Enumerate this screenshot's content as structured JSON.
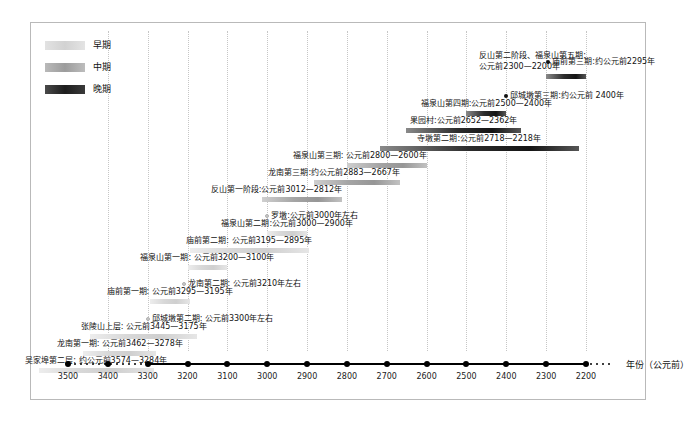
{
  "legend": {
    "items": [
      {
        "label": "早期",
        "key": "early",
        "color": "#d8d8d8"
      },
      {
        "label": "中期",
        "key": "middle",
        "color": "#9c9c9c"
      },
      {
        "label": "晚期",
        "key": "late",
        "color": "#1d1d1d"
      }
    ]
  },
  "axis": {
    "title": "年份（公元前）",
    "ticks": [
      3500,
      3400,
      3300,
      3200,
      3100,
      3000,
      2900,
      2800,
      2700,
      2600,
      2500,
      2400,
      2300,
      2200
    ],
    "domain_start": 3500,
    "domain_end": 2200,
    "dotted_left_from": 3500,
    "dotted_left_to": 3300,
    "dotted_right": true
  },
  "chart_data": {
    "type": "bar",
    "title": "",
    "xlabel": "年份（公元前）",
    "ylabel": "",
    "xlim": [
      3500,
      2200
    ],
    "grid": true,
    "orientation": "horizontal-timeline",
    "legend_position": "top-left",
    "series": [
      {
        "name": "早期",
        "color": "#d8d8d8"
      },
      {
        "name": "中期",
        "color": "#9c9c9c"
      },
      {
        "name": "晚期",
        "color": "#1d1d1d"
      }
    ],
    "items": [
      {
        "label": "庙前第三期:约公元前2295年",
        "start": 2295,
        "end": 2295,
        "period": "late",
        "label_align": "right",
        "marker": "dot",
        "row": 0
      },
      {
        "label": "反山第二阶段、福泉山第五期: 公元前2300—2200年",
        "start": 2300,
        "end": 2200,
        "period": "late",
        "label_align": "right",
        "marker": "bar",
        "row": 1,
        "two_line": true,
        "line1": "反山第二阶段、福泉山第五期:",
        "line2": "公元前2300—2200年"
      },
      {
        "label": "邱城墩第三期:约公元前 2400年",
        "start": 2400,
        "end": 2400,
        "period": "late",
        "label_align": "right",
        "marker": "dot",
        "row": 2
      },
      {
        "label": "福泉山第四期:公元前2500—2400年",
        "start": 2500,
        "end": 2400,
        "period": "late",
        "label_align": "mid",
        "marker": "bar",
        "row": 3
      },
      {
        "label": "果园村:公元前2652—2362年",
        "start": 2652,
        "end": 2362,
        "period": "late",
        "label_align": "mid",
        "marker": "bar",
        "row": 4
      },
      {
        "label": "寺墩第二期:公元前2718—2218年",
        "start": 2718,
        "end": 2218,
        "period": "late",
        "label_align": "mid",
        "marker": "bar",
        "row": 5
      },
      {
        "label": "福泉山第三期: 公元前2800—2600年",
        "start": 2800,
        "end": 2600,
        "period": "middle",
        "label_align": "right",
        "marker": "bar",
        "row": 6
      },
      {
        "label": "龙南第三期:约公元前2883—2667年",
        "start": 2883,
        "end": 2667,
        "period": "middle",
        "label_align": "right",
        "marker": "bar",
        "row": 7
      },
      {
        "label": "反山第一阶段:公元前3012—2812年",
        "start": 3012,
        "end": 2812,
        "period": "middle",
        "label_align": "right",
        "marker": "bar",
        "row": 8
      },
      {
        "label": "罗墩:公元前3000年左右",
        "start": 3000,
        "end": 3000,
        "period": "early",
        "label_align": "left",
        "marker": "dot",
        "row": 9
      },
      {
        "label": "福泉山第二期:公元前3000—2900年",
        "start": 3000,
        "end": 2900,
        "period": "early",
        "label_align": "mid",
        "marker": "bar",
        "row": 10
      },
      {
        "label": "庙前第二期: 公元前3195—2895年",
        "start": 3195,
        "end": 2895,
        "period": "early",
        "label_align": "mid",
        "marker": "bar",
        "row": 11
      },
      {
        "label": "福泉山第一期: 公元前3200—3100年",
        "start": 3200,
        "end": 3100,
        "period": "early",
        "label_align": "mid",
        "marker": "bar",
        "row": 12
      },
      {
        "label": "龙南第二期: 公元前3210年左右",
        "start": 3210,
        "end": 3210,
        "period": "early",
        "label_align": "left",
        "marker": "dot",
        "row": 13
      },
      {
        "label": "庙前第一期: 公元前3295—3195年",
        "start": 3295,
        "end": 3195,
        "period": "early",
        "label_align": "mid",
        "marker": "bar",
        "row": 14
      },
      {
        "label": "邱城墩第二期: 公元前3300年左右",
        "start": 3300,
        "end": 3300,
        "period": "early",
        "label_align": "left",
        "marker": "dot",
        "row": 15
      },
      {
        "label": "张陵山上层: 公元前3445—3175年",
        "start": 3445,
        "end": 3175,
        "period": "early",
        "label_align": "mid",
        "marker": "bar",
        "row": 16
      },
      {
        "label": "龙南第一期: 公元前3462—3278年",
        "start": 3462,
        "end": 3278,
        "period": "early",
        "label_align": "mid",
        "marker": "bar",
        "row": 17
      },
      {
        "label": "吴家埠第二层: 约公元前3574—3284年",
        "start": 3574,
        "end": 3284,
        "period": "early",
        "label_align": "mid",
        "marker": "bar",
        "row": 18
      }
    ]
  }
}
